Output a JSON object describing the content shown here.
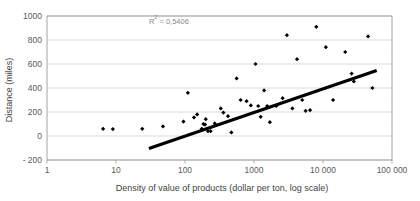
{
  "chart_data": {
    "type": "scatter",
    "title": "",
    "xlabel": "Density of value of products (dollar per ton, log scale)",
    "ylabel": "Distance (miles)",
    "xscale": "log",
    "yscale": "linear",
    "xlim": [
      1,
      100000
    ],
    "ylim": [
      -200,
      1000
    ],
    "ytick_labels": [
      "1000",
      "800",
      "600",
      "400",
      "200",
      "0",
      "- 200"
    ],
    "ytick_values": [
      1000,
      800,
      600,
      400,
      200,
      0,
      -200
    ],
    "xtick_labels": [
      "1",
      "10",
      "100",
      "1000",
      "10 000",
      "100 000"
    ],
    "xtick_values": [
      1,
      10,
      100,
      1000,
      10000,
      100000
    ],
    "grid": true,
    "grid_axis": "y",
    "legend": false,
    "annotations": [
      {
        "name": "r-squared",
        "text_prefix": "R",
        "text_sup": "2",
        "text_suffix": " = 0,5406",
        "full_text": "R2 = 0,5406",
        "x": 30,
        "y": 930
      }
    ],
    "series": [
      {
        "name": "observations",
        "marker": "diamond",
        "color": "#000000",
        "points": [
          [
            6.5,
            60
          ],
          [
            9.0,
            58
          ],
          [
            24.0,
            60
          ],
          [
            48.0,
            80
          ],
          [
            95.0,
            120
          ],
          [
            110.0,
            360
          ],
          [
            135.0,
            155
          ],
          [
            150.0,
            180
          ],
          [
            175.0,
            60
          ],
          [
            185.0,
            100
          ],
          [
            195.0,
            95
          ],
          [
            200.0,
            140
          ],
          [
            215.0,
            40
          ],
          [
            235.0,
            40
          ],
          [
            270.0,
            105
          ],
          [
            330.0,
            230
          ],
          [
            360.0,
            195
          ],
          [
            420.0,
            165
          ],
          [
            470.0,
            30
          ],
          [
            560.0,
            480
          ],
          [
            640.0,
            300
          ],
          [
            780.0,
            290
          ],
          [
            900.0,
            255
          ],
          [
            1050.0,
            600
          ],
          [
            1150.0,
            250
          ],
          [
            1250.0,
            160
          ],
          [
            1400.0,
            380
          ],
          [
            1550.0,
            250
          ],
          [
            1700.0,
            115
          ],
          [
            2100.0,
            250
          ],
          [
            2600.0,
            315
          ],
          [
            3000.0,
            840
          ],
          [
            3600.0,
            230
          ],
          [
            4200.0,
            640
          ],
          [
            5000.0,
            300
          ],
          [
            5600.0,
            210
          ],
          [
            6500.0,
            215
          ],
          [
            8000.0,
            910
          ],
          [
            11000.0,
            740
          ],
          [
            14000.0,
            300
          ],
          [
            21000.0,
            700
          ],
          [
            26000.0,
            520
          ],
          [
            28000.0,
            455
          ],
          [
            45000.0,
            830
          ],
          [
            52000.0,
            400
          ]
        ]
      }
    ],
    "trendline": {
      "name": "linear-fit",
      "color": "#000000",
      "x_start": 30,
      "y_start": -105,
      "x_end": 60000,
      "y_end": 545
    }
  },
  "axes": {
    "y_title": "Distance (miles)",
    "x_title": "Density of value of products (dollar per ton, log scale)"
  }
}
